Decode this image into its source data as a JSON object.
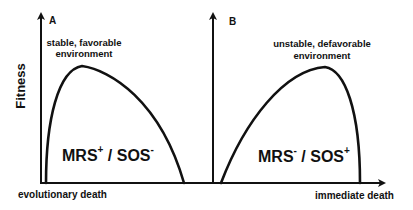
{
  "figure": {
    "y_axis_label": "Fitness",
    "panels": [
      {
        "id": "A",
        "label": "A",
        "environment_line1": "stable, favorable",
        "environment_line2": "environment",
        "genotype_main1": "MRS",
        "genotype_sup1": "+",
        "genotype_sep": " / ",
        "genotype_main2": "SOS",
        "genotype_sup2": "-",
        "endpoint_label": "evolutionary death"
      },
      {
        "id": "B",
        "label": "B",
        "environment_line1": "unstable, defavorable",
        "environment_line2": "environment",
        "genotype_main1": "MRS",
        "genotype_sup1": "-",
        "genotype_sep": " / ",
        "genotype_main2": "SOS",
        "genotype_sup2": "+",
        "endpoint_label": "immediate death"
      }
    ],
    "colors": {
      "ink": "#111111",
      "background": "#ffffff"
    }
  }
}
